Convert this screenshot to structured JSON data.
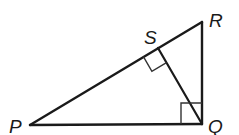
{
  "diagram": {
    "type": "geometry",
    "stroke_color": "#1a1a1a",
    "points": {
      "P": {
        "label": "P",
        "x": 30,
        "y": 125
      },
      "Q": {
        "label": "Q",
        "x": 202,
        "y": 124
      },
      "R": {
        "label": "R",
        "x": 202,
        "y": 22
      },
      "S": {
        "label": "S",
        "x": 158,
        "y": 48
      }
    },
    "segments": [
      {
        "from": "P",
        "to": "Q"
      },
      {
        "from": "Q",
        "to": "R"
      },
      {
        "from": "P",
        "to": "R"
      },
      {
        "from": "S",
        "to": "Q"
      }
    ],
    "right_angles": [
      {
        "vertex": "Q",
        "between": [
          "P",
          "R"
        ]
      },
      {
        "vertex": "S",
        "between": [
          "P",
          "Q"
        ]
      }
    ],
    "labels": {
      "P": "P",
      "Q": "Q",
      "R": "R",
      "S": "S"
    }
  }
}
